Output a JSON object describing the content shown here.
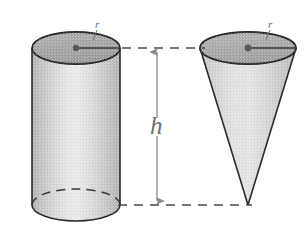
{
  "figure": {
    "background_color": "#ffffff",
    "width": 308,
    "height": 229,
    "labels": {
      "height_label": "h",
      "radius_label_cylinder": "r",
      "radius_label_cone": "r"
    },
    "colors": {
      "outline": "#2b2b2b",
      "dimension_line": "#8a8a8a",
      "dashed_guide": "#4a4a4a",
      "label_text": "#6e6e6e",
      "top_face_fill": "#a9a9a9",
      "body_fill_light": "#e3e3e3",
      "body_fill_dark": "#b4b4b4",
      "cone_fill_light": "#dcdcdc",
      "cone_fill_dark": "#bfbfbf",
      "center_dot": "#5a5a5a"
    },
    "shapes": [
      {
        "name": "cylinder",
        "type": "cylinder",
        "center_x": 76,
        "top_center_y": 48,
        "bottom_center_y": 205,
        "radius_x": 44,
        "radius_y": 16,
        "radius_label": "r",
        "height_label": "h"
      },
      {
        "name": "cone",
        "type": "cone",
        "center_x": 248,
        "top_center_y": 48,
        "apex_y": 205,
        "radius_x": 48,
        "radius_y": 16,
        "radius_label": "r",
        "height_label": "h"
      }
    ],
    "dimension": {
      "name": "height-dimension",
      "label": "h",
      "arrow_x": 157,
      "arrow_top_y": 52,
      "arrow_bottom_y": 202,
      "guide_top_y": 48,
      "guide_bottom_y": 205
    }
  }
}
